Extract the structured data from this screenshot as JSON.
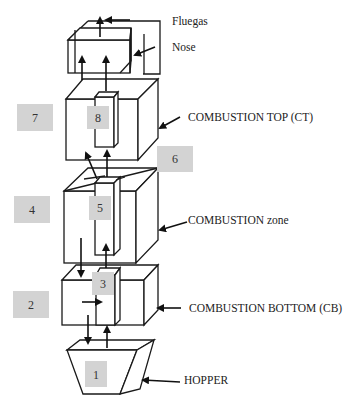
{
  "diagram": {
    "type": "boiler-zone-schematic",
    "labels": {
      "fluegas": "Fluegas",
      "nose": "Nose",
      "combustion_top": "COMBUSTION TOP (CT)",
      "combustion_zone": "COMBUSTION zone",
      "combustion_bottom": "COMBUSTION BOTTOM (CB)",
      "hopper": "HOPPER"
    },
    "zone_numbers": {
      "z1": "1",
      "z2": "2",
      "z3": "3",
      "z4": "4",
      "z5": "5",
      "z6": "6",
      "z7": "7",
      "z8": "8"
    },
    "colors": {
      "line": "#1a1a1a",
      "zone_box": "#d3d3d3",
      "text": "#222222"
    }
  }
}
